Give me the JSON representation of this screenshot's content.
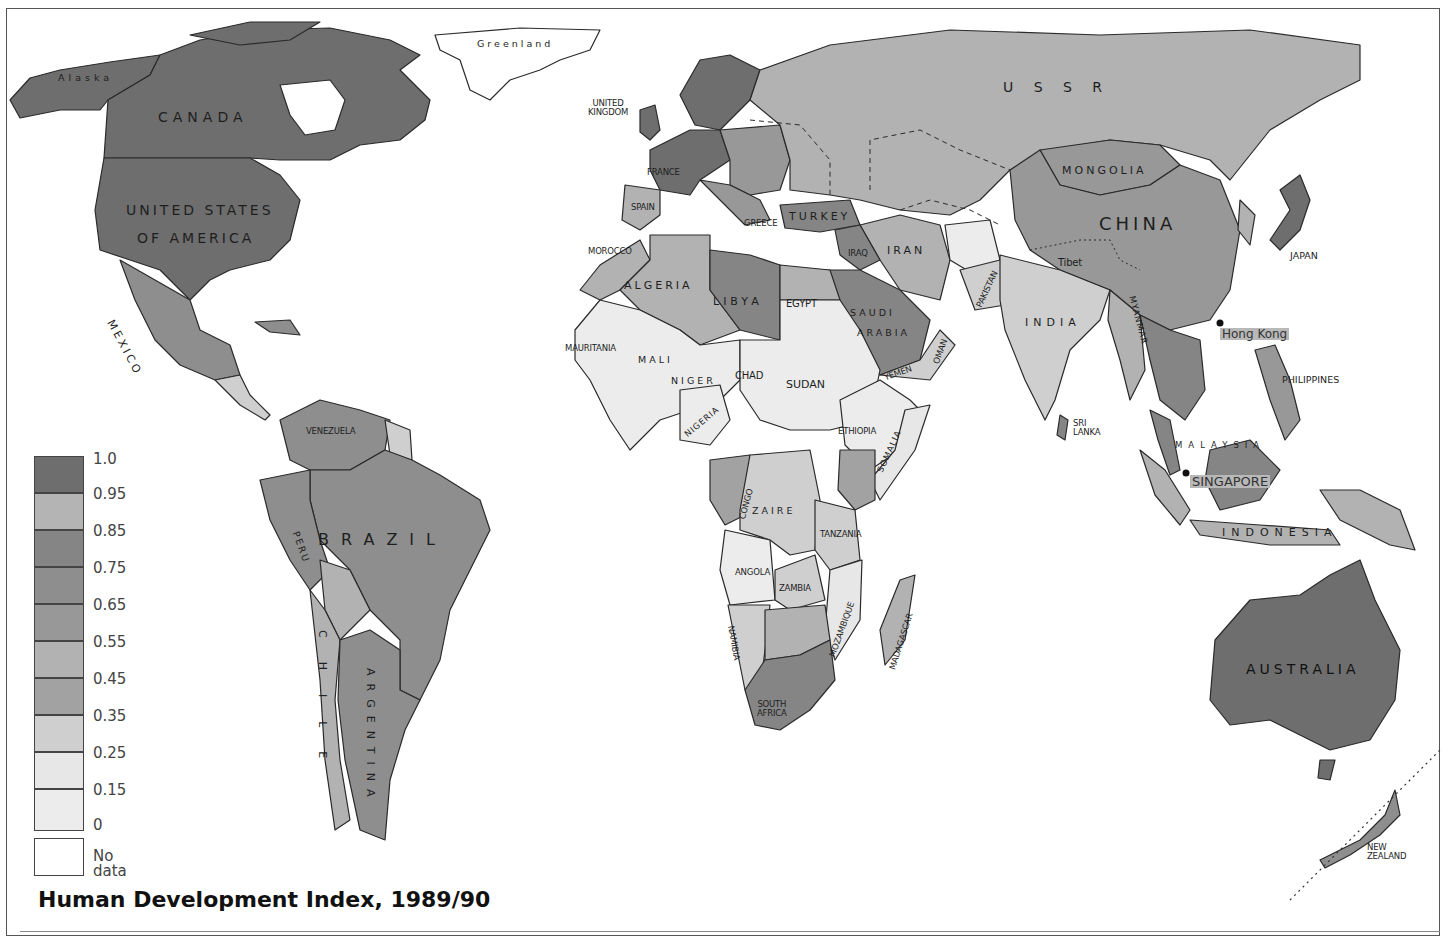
{
  "title": "Human Development Index, 1989/90",
  "legend": {
    "bins": [
      {
        "upper": "1.0",
        "lower": "0.95",
        "color": "#6e6e6e"
      },
      {
        "upper": "0.95",
        "lower": "0.85",
        "color": "#b4b4b4"
      },
      {
        "upper": "0.85",
        "lower": "0.75",
        "color": "#858585"
      },
      {
        "upper": "0.75",
        "lower": "0.65",
        "color": "#8e8e8e"
      },
      {
        "upper": "0.65",
        "lower": "0.55",
        "color": "#989898"
      },
      {
        "upper": "0.55",
        "lower": "0.45",
        "color": "#b2b2b2"
      },
      {
        "upper": "0.45",
        "lower": "0.35",
        "color": "#a2a2a2"
      },
      {
        "upper": "0.35",
        "lower": "0.25",
        "color": "#cfcfcf"
      },
      {
        "upper": "0.25",
        "lower": "0.15",
        "color": "#e7e7e7"
      },
      {
        "upper": "0.15",
        "lower": "0",
        "color": "#ececec"
      }
    ],
    "ticks": [
      "1.0",
      "0.95",
      "0.85",
      "0.75",
      "0.65",
      "0.55",
      "0.45",
      "0.35",
      "0.25",
      "0.15",
      "0"
    ],
    "no_data_label": "No data",
    "no_data_color": "#ffffff"
  },
  "labels": {
    "alaska": "Alaska",
    "canada": "CANADA",
    "greenland": "Greenland",
    "usa_line1": "UNITED STATES",
    "usa_line2": "OF AMERICA",
    "mexico": "MEXICO",
    "venezuela": "VENEZUELA",
    "brazil": "BRAZIL",
    "peru": "PERU",
    "chile": "CHILE",
    "argentina": "ARGENTINA",
    "uk_line1": "UNITED",
    "uk_line2": "KINGDOM",
    "france": "FRANCE",
    "spain": "SPAIN",
    "greece": "GREECE",
    "turkey": "TURKEY",
    "ussr": "U S S R",
    "mongolia": "MONGOLIA",
    "china": "CHINA",
    "tibet": "Tibet",
    "japan": "JAPAN",
    "iraq": "IRAQ",
    "iran": "IRAN",
    "pakistan": "PAKISTAN",
    "india": "INDIA",
    "myanmar": "MYANMAR",
    "hong_kong": "Hong Kong",
    "philippines": "PHILIPPINES",
    "sri_lanka_line1": "SRI",
    "sri_lanka_line2": "LANKA",
    "malaysia": "MALAYSIA",
    "singapore": "SINGAPORE",
    "indonesia": "INDONESIA",
    "australia": "AUSTRALIA",
    "new_zealand_line1": "NEW",
    "new_zealand_line2": "ZEALAND",
    "morocco": "MOROCCO",
    "algeria": "ALGERIA",
    "libya": "LIBYA",
    "egypt": "EGYPT",
    "saudi_line1": "SAUDI",
    "saudi_line2": "ARABIA",
    "oman": "OMAN",
    "yemen": "YEMEN",
    "mauritania": "MAURITANIA",
    "mali": "MALI",
    "niger": "NIGER",
    "chad": "CHAD",
    "sudan": "SUDAN",
    "nigeria": "NIGERIA",
    "ethiopia": "ETHIOPIA",
    "somalia": "SOMALIA",
    "congo": "CONGO",
    "zaire": "ZAIRE",
    "tanzania": "TANZANIA",
    "angola": "ANGOLA",
    "zambia": "ZAMBIA",
    "namibia": "NAMIBIA",
    "mozambique": "MOZAMBIQUE",
    "madagascar": "MADAGASCAR",
    "south_africa_line1": "SOUTH",
    "south_africa_line2": "AFRICA"
  },
  "colors": {
    "very_high": "#6e6e6e",
    "high": "#858585",
    "upper_mid": "#8e8e8e",
    "mid": "#989898",
    "lower_mid": "#b2b2b2",
    "low": "#cfcfcf",
    "very_low": "#e9e9e9",
    "no_data": "#ffffff",
    "border": "#2a2a2a",
    "ocean": "#ffffff"
  }
}
